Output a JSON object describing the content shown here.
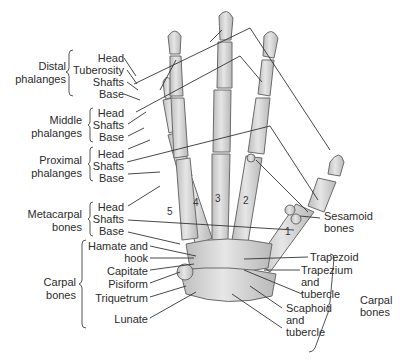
{
  "figure": {
    "groups": {
      "distal": {
        "name": "Distal phalanges",
        "parts": [
          "Head",
          "Tuberosity",
          "Shafts",
          "Base"
        ]
      },
      "middle": {
        "name": "Middle phalanges",
        "parts": [
          "Head",
          "Shafts",
          "Base"
        ]
      },
      "proximal": {
        "name": "Proximal phalanges",
        "parts": [
          "Head",
          "Shafts",
          "Base"
        ]
      },
      "metacarpal": {
        "name": "Metacarpal bones",
        "parts": [
          "Head",
          "Shafts",
          "Base"
        ]
      },
      "carpal_left": {
        "name": "Carpal bones",
        "parts": [
          "Hamate and hook",
          "Capitate",
          "Pisiform",
          "Triquetrum",
          "Lunate"
        ]
      },
      "carpal_right": {
        "name": "Carpal bones",
        "parts": [
          "Trapezoid",
          "Trapezium and tubercle",
          "Scaphoid and tubercle"
        ]
      },
      "sesamoid": {
        "name": "Sesamoid bones"
      }
    },
    "labels": {
      "distal_1": "Distal",
      "distal_2": "phalanges",
      "middle_1": "Middle",
      "middle_2": "phalanges",
      "proximal_1": "Proximal",
      "proximal_2": "phalanges",
      "metacarpal_1": "Metacarpal",
      "metacarpal_2": "bones",
      "carpal_1": "Carpal",
      "carpal_2": "bones",
      "head": "Head",
      "tuberosity": "Tuberosity",
      "shafts": "Shafts",
      "base": "Base",
      "hamate_1": "Hamate and",
      "hamate_2": "hook",
      "capitate": "Capitate",
      "pisiform": "Pisiform",
      "triquetrum": "Triquetrum",
      "lunate": "Lunate",
      "sesamoid_1": "Sesamoid",
      "sesamoid_2": "bones",
      "trapezoid": "Trapezoid",
      "trapezium_1": "Trapezium",
      "trapezium_2": "and",
      "trapezium_3": "tubercle",
      "scaphoid_1": "Scaphoid",
      "scaphoid_2": "and",
      "scaphoid_3": "tubercle",
      "carpal_r1": "Carpal",
      "carpal_r2": "bones"
    },
    "metacarpal_numbers": [
      "1",
      "2",
      "3",
      "4",
      "5"
    ],
    "colors": {
      "bone_fill": "#d9d9d9",
      "bone_stroke": "#6b6b6b",
      "leader": "#333333",
      "text": "#2b2b2b"
    }
  }
}
